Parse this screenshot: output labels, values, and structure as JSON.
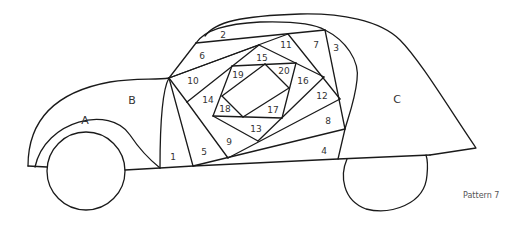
{
  "diagram": {
    "type": "paper-piecing-pattern",
    "caption": "Pattern 7",
    "section_labels": {
      "A": "A",
      "B": "B",
      "C": "C"
    },
    "piece_labels": {
      "p1": "1",
      "p2": "2",
      "p3": "3",
      "p4": "4",
      "p5": "5",
      "p6": "6",
      "p7": "7",
      "p8": "8",
      "p9": "9",
      "p10": "10",
      "p11": "11",
      "p12": "12",
      "p13": "13",
      "p14": "14",
      "p15": "15",
      "p16": "16",
      "p17": "17",
      "p18": "18",
      "p19": "19",
      "p20": "20"
    },
    "colors": {
      "stroke": "#1a1a1a",
      "background": "#ffffff",
      "label": "#333333"
    }
  }
}
